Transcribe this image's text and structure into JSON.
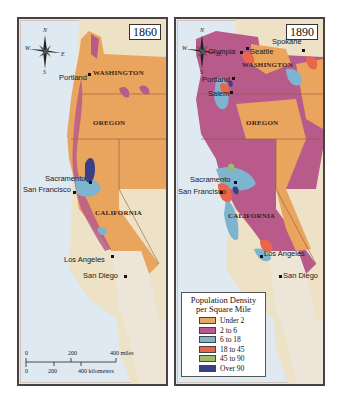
{
  "maps": [
    {
      "year": "1860",
      "states": [
        "WASHINGTON",
        "OREGON",
        "CALIFORNIA"
      ],
      "cities": [
        "Portland",
        "Sacramento",
        "San Francisco",
        "Los Angeles",
        "San Diego"
      ]
    },
    {
      "year": "1890",
      "states": [
        "WASHINGTON",
        "OREGON",
        "CALIFORNIA"
      ],
      "cities": [
        "Olympia",
        "Seattle",
        "Spokane",
        "Portland",
        "Salem",
        "Sacramento",
        "San Francisco",
        "Los Angeles",
        "San Diego"
      ]
    }
  ],
  "compass": {
    "n": "N",
    "s": "S",
    "e": "E",
    "w": "W"
  },
  "scale": {
    "miles": [
      "0",
      "200",
      "400 miles"
    ],
    "kilometers": [
      "0",
      "200",
      "400 kilometers"
    ]
  },
  "legend": {
    "title_line1": "Population Density",
    "title_line2": "per Square Mile",
    "items": [
      {
        "label": "Under 2",
        "color": "#e8a862"
      },
      {
        "label": "2 to 6",
        "color": "#b85a8a"
      },
      {
        "label": "6 to 18",
        "color": "#7db4cf"
      },
      {
        "label": "18 to 45",
        "color": "#e8674a"
      },
      {
        "label": "45 to 90",
        "color": "#9dbb6a"
      },
      {
        "label": "Over 90",
        "color": "#3b3f86"
      }
    ]
  },
  "colors": {
    "ocean": "#dfe9f2",
    "land_other": "#ede2c6",
    "state_fill": "#e9a55e"
  }
}
